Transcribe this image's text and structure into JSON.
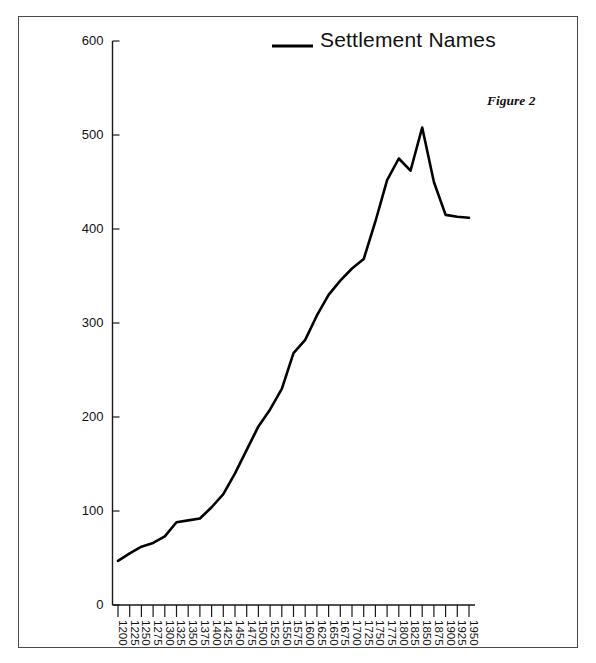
{
  "figure": {
    "caption": "Figure 2",
    "legend_label": "Settlement Names",
    "legend_icon": "line-swatch-icon"
  },
  "chart_data": {
    "type": "line",
    "title": "",
    "xlabel": "",
    "ylabel": "",
    "xlim": [
      1200,
      1950
    ],
    "ylim": [
      0,
      600
    ],
    "yticks": [
      0,
      100,
      200,
      300,
      400,
      500,
      600
    ],
    "ytick_labels": [
      "0",
      "100",
      "200",
      "300",
      "400",
      "500",
      "600"
    ],
    "grid": false,
    "legend_position": "top-center",
    "categories": [
      "1200",
      "1225",
      "1250",
      "1275",
      "1300",
      "1325",
      "1350",
      "1375",
      "1400",
      "1425",
      "1450",
      "1475",
      "1500",
      "1525",
      "1550",
      "1575",
      "1600",
      "1625",
      "1650",
      "1675",
      "1700",
      "1725",
      "1750",
      "1775",
      "1800",
      "1825",
      "1850",
      "1875",
      "1900",
      "1925",
      "1950"
    ],
    "series": [
      {
        "name": "Settlement Names",
        "color": "#000000",
        "values": [
          47,
          55,
          62,
          66,
          73,
          88,
          90,
          92,
          104,
          118,
          140,
          165,
          190,
          208,
          230,
          268,
          282,
          308,
          330,
          345,
          358,
          368,
          408,
          452,
          475,
          462,
          508,
          450,
          415,
          413,
          412
        ]
      }
    ]
  }
}
